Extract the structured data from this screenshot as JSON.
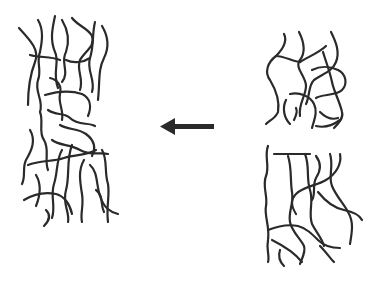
{
  "diagram": {
    "colors": {
      "stroke": "#2a2a2a",
      "background": "#ffffff"
    },
    "left_network": {
      "label": ""
    },
    "right_top_network": {
      "label": ""
    },
    "right_bottom_network": {
      "label": ""
    },
    "arrow": {
      "direction": "left"
    }
  }
}
